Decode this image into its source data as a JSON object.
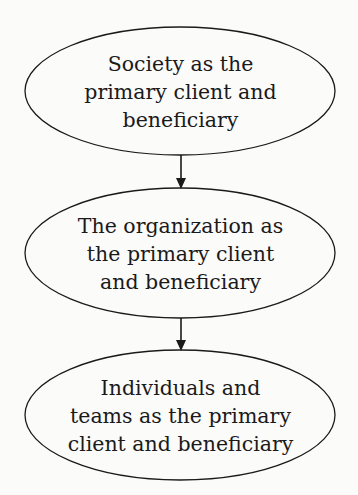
{
  "diagram": {
    "type": "vertical-flow",
    "nodes": [
      {
        "id": "society",
        "lines": [
          "Society as the",
          "primary client and",
          "beneficiary"
        ]
      },
      {
        "id": "organization",
        "lines": [
          "The organization as",
          "the primary client",
          "and beneficiary"
        ]
      },
      {
        "id": "individuals",
        "lines": [
          "Individuals and",
          "teams as the primary",
          "client and beneficiary"
        ]
      }
    ],
    "edges": [
      {
        "from": "society",
        "to": "organization"
      },
      {
        "from": "organization",
        "to": "individuals"
      }
    ],
    "colors": {
      "stroke": "#1a1a1a",
      "background": "#fbfbfa",
      "text": "#1a1a1a"
    }
  }
}
